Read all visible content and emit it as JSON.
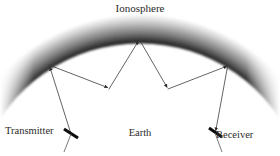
{
  "figure": {
    "width": 280,
    "height": 156,
    "background_color": "#ffffff"
  },
  "labels": {
    "ionosphere": "Ionosphere",
    "earth": "Earth",
    "transmitter": "Transmitter",
    "receiver": "Receiver"
  },
  "colors": {
    "ionosphere_light": "#ffffff",
    "ionosphere_mid": "#9a9a9a",
    "ionosphere_dark": "#3a3a3a",
    "earth_arc": "#4a4a4a",
    "ray": "#3c3c3c",
    "antenna": "#111111",
    "text": "#2b2b2b"
  },
  "geometry": {
    "ionosphere_band": {
      "center_x": 140,
      "center_y": 205,
      "outer_radius": 190,
      "inner_radius": 168,
      "start_angle_deg": 200,
      "end_angle_deg": 340
    },
    "earth_arc": {
      "center_x": 140,
      "center_y": 300,
      "radius": 212,
      "start_angle_deg": 208,
      "end_angle_deg": 332
    },
    "ray_path_points": [
      {
        "name": "transmitter",
        "x": 71,
        "y": 134
      },
      {
        "name": "ionosphere-hop-1",
        "x": 49,
        "y": 65
      },
      {
        "name": "earth-hop-1",
        "x": 109,
        "y": 89
      },
      {
        "name": "ionosphere-hop-2",
        "x": 139,
        "y": 39
      },
      {
        "name": "earth-hop-2",
        "x": 168,
        "y": 89
      },
      {
        "name": "ionosphere-hop-3",
        "x": 228,
        "y": 64
      },
      {
        "name": "receiver",
        "x": 215,
        "y": 133
      }
    ],
    "arrowheads": [
      {
        "at": "ionosphere-hop-1",
        "x": 49,
        "y": 65
      },
      {
        "at": "earth-hop-1",
        "x": 109,
        "y": 89
      },
      {
        "at": "ionosphere-hop-2",
        "x": 139,
        "y": 39
      },
      {
        "at": "earth-hop-2",
        "x": 168,
        "y": 89
      },
      {
        "at": "ionosphere-hop-3",
        "x": 228,
        "y": 64
      },
      {
        "at": "receiver",
        "x": 215,
        "y": 133
      }
    ]
  }
}
